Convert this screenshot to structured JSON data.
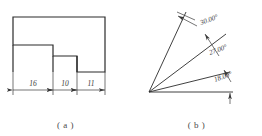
{
  "figure_a": {
    "caption": "( a )",
    "shape_name": "stepped-profile-outline",
    "dimensions": [
      {
        "label": "16",
        "segment": "left"
      },
      {
        "label": "10",
        "segment": "middle"
      },
      {
        "label": "11",
        "segment": "right"
      }
    ]
  },
  "figure_b": {
    "caption": "( b )",
    "shape_name": "angular-ray-fan",
    "angles": [
      {
        "label": "30.00°"
      },
      {
        "label": "27.00°"
      },
      {
        "label": "18.00°"
      }
    ]
  },
  "colors": {
    "outline": "#2b2b2b",
    "thin_line": "#3a3a3a",
    "text": "#3a3a3a",
    "caption": "#4a4a4a",
    "background": "#ffffff"
  }
}
